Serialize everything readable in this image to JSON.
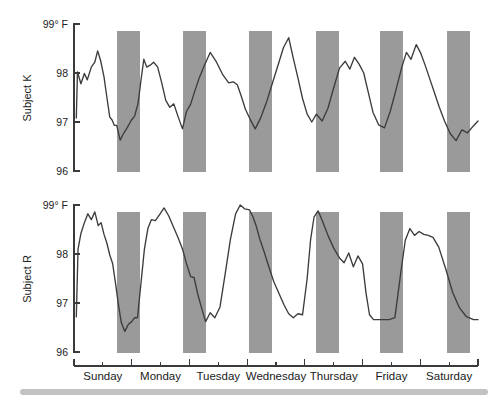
{
  "figure": {
    "background_color": "#ffffff",
    "line_color": "#3c3c3c",
    "band_color": "#9a9a9a",
    "axis_color": "#3a3a3a",
    "page_edge_color": "#c2c2c2"
  },
  "panels": [
    {
      "id": "subject-k",
      "axis_title": "Subject K",
      "y_ticks": [
        "99° F",
        "98",
        "97",
        "96"
      ]
    },
    {
      "id": "subject-r",
      "axis_title": "Subject R",
      "y_ticks": [
        "99° F",
        "98",
        "97",
        "96"
      ]
    }
  ],
  "x_axis": {
    "day_labels": [
      "Sunday",
      "Monday",
      "Tuesday",
      "Wednesday",
      "Thursday",
      "Friday",
      "Saturday"
    ]
  },
  "chart_data": {
    "type": "line",
    "title": "",
    "xlabel": "",
    "ylabel": "Body temperature",
    "ylim": [
      96,
      99
    ],
    "y_ticks": [
      96,
      97,
      98,
      99
    ],
    "y_tick_labels": [
      "96",
      "97",
      "98",
      "99° F"
    ],
    "y_unit": "degrees Fahrenheit",
    "x_unit": "days",
    "xlim": [
      0,
      7
    ],
    "x_tick_labels": [
      "Sunday",
      "Monday",
      "Tuesday",
      "Wednesday",
      "Thursday",
      "Friday",
      "Saturday"
    ],
    "x_minor_ticks_per_day": 2,
    "grid": false,
    "legend": null,
    "annotations": [
      {
        "type": "shaded-bands",
        "label": "sleep / night periods",
        "color": "#9a9a9a",
        "spans_days": [
          [
            0.64,
            0.99
          ],
          [
            1.73,
            2.06
          ],
          [
            2.71,
            3.06
          ],
          [
            3.72,
            4.07
          ],
          [
            4.67,
            5.02
          ],
          [
            5.68,
            6.03
          ]
        ]
      }
    ],
    "series": [
      {
        "name": "Subject K",
        "panel": "subject-k",
        "x": [
          0.04,
          0.06,
          0.12,
          0.18,
          0.23,
          0.3,
          0.36,
          0.41,
          0.46,
          0.52,
          0.57,
          0.62,
          0.66,
          0.7,
          0.74,
          0.8,
          0.86,
          0.92,
          0.99,
          1.05,
          1.11,
          1.16,
          1.21,
          1.26,
          1.32,
          1.38,
          1.45,
          1.52,
          1.59,
          1.66,
          1.73,
          1.8,
          1.88,
          1.95,
          2.02,
          2.09,
          2.17,
          2.26,
          2.36,
          2.47,
          2.58,
          2.68,
          2.76,
          2.83,
          2.9,
          2.97,
          3.05,
          3.14,
          3.24,
          3.34,
          3.44,
          3.54,
          3.63,
          3.72,
          3.8,
          3.88,
          3.96,
          4.04,
          4.12,
          4.2,
          4.3,
          4.4,
          4.5,
          4.6,
          4.7,
          4.78,
          4.86,
          4.94,
          5.02,
          5.1,
          5.18,
          5.28,
          5.38,
          5.48,
          5.58,
          5.68,
          5.76,
          5.84,
          5.93,
          6.01
        ],
        "y": [
          97.08,
          98.02,
          97.78,
          97.99,
          97.86,
          98.12,
          98.22,
          98.45,
          98.26,
          97.92,
          97.5,
          97.1,
          97.04,
          96.93,
          96.93,
          96.63,
          96.77,
          96.88,
          97.03,
          97.12,
          97.38,
          97.85,
          98.28,
          98.12,
          98.16,
          98.22,
          98.12,
          97.8,
          97.44,
          97.3,
          97.37,
          97.12,
          96.86,
          97.22,
          97.36,
          97.62,
          97.9,
          98.16,
          98.42,
          98.22,
          97.96,
          97.8,
          97.82,
          97.76,
          97.52,
          97.26,
          97.06,
          96.86,
          97.1,
          97.42,
          97.8,
          98.18,
          98.52,
          98.72,
          98.3,
          97.9,
          97.48,
          97.16,
          97.0,
          97.16,
          97.02,
          97.28,
          97.7,
          98.1,
          98.24,
          98.08,
          98.32,
          98.18,
          98.0,
          97.6,
          97.2,
          96.94,
          96.88,
          97.22,
          97.66,
          98.12,
          98.42,
          98.28,
          98.58,
          98.4
        ],
        "y_tail_x": [
          6.09,
          6.17,
          6.25,
          6.33,
          6.42,
          6.52,
          6.62,
          6.72,
          6.82,
          6.92,
          7.0
        ],
        "y_tail_y": [
          98.14,
          97.86,
          97.58,
          97.3,
          97.02,
          96.76,
          96.62,
          96.84,
          96.78,
          96.92,
          97.02
        ]
      },
      {
        "name": "Subject R",
        "panel": "subject-r",
        "x": [
          0.04,
          0.07,
          0.12,
          0.18,
          0.24,
          0.3,
          0.36,
          0.42,
          0.47,
          0.52,
          0.57,
          0.62,
          0.67,
          0.72,
          0.77,
          0.82,
          0.88,
          0.94,
          1.0,
          1.05,
          1.1,
          1.16,
          1.22,
          1.28,
          1.34,
          1.41,
          1.48,
          1.56,
          1.64,
          1.72,
          1.8,
          1.88,
          1.95,
          2.02,
          2.08,
          2.14,
          2.21,
          2.28,
          2.36,
          2.44,
          2.53,
          2.62,
          2.71,
          2.8,
          2.88,
          2.96,
          3.04,
          3.1,
          3.16,
          3.22,
          3.29,
          3.37,
          3.46,
          3.55,
          3.64,
          3.72,
          3.8,
          3.88,
          3.96,
          4.04,
          4.1,
          4.16,
          4.23,
          4.31,
          4.4,
          4.5,
          4.6,
          4.68,
          4.76,
          4.84,
          4.92,
          5.0,
          5.06,
          5.12,
          5.19,
          5.27,
          5.36,
          5.46,
          5.56,
          5.66,
          5.74,
          5.82,
          5.9,
          5.98,
          6.06,
          6.14,
          6.22,
          6.32,
          6.44,
          6.56,
          6.68,
          6.8,
          6.92,
          7.0
        ],
        "y": [
          96.72,
          98.1,
          98.42,
          98.64,
          98.82,
          98.7,
          98.86,
          98.58,
          98.64,
          98.4,
          98.22,
          97.98,
          97.8,
          97.4,
          96.96,
          96.6,
          96.42,
          96.56,
          96.62,
          96.7,
          96.7,
          97.4,
          98.1,
          98.52,
          98.7,
          98.68,
          98.8,
          98.94,
          98.78,
          98.56,
          98.34,
          98.1,
          97.8,
          97.54,
          97.52,
          97.2,
          96.9,
          96.62,
          96.8,
          96.7,
          96.92,
          97.6,
          98.3,
          98.82,
          99.0,
          98.92,
          98.9,
          98.76,
          98.56,
          98.3,
          98.06,
          97.76,
          97.44,
          97.2,
          96.96,
          96.78,
          96.7,
          96.78,
          96.76,
          97.5,
          98.3,
          98.76,
          98.88,
          98.66,
          98.38,
          98.12,
          97.92,
          97.82,
          98.02,
          97.74,
          97.96,
          97.8,
          97.2,
          96.76,
          96.66,
          96.66,
          96.66,
          96.66,
          96.7,
          97.6,
          98.28,
          98.52,
          98.38,
          98.46,
          98.4,
          98.38,
          98.34,
          98.14,
          97.7,
          97.22,
          96.9,
          96.72,
          96.66,
          96.66
        ]
      }
    ]
  }
}
